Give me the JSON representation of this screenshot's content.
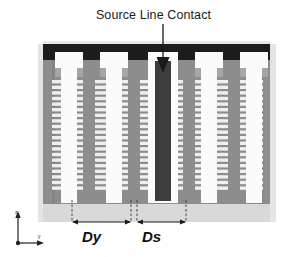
{
  "figure": {
    "type": "cross-section-schematic",
    "annotation": {
      "title": "Source Line Contact",
      "pointer": "downward-arrow"
    },
    "dimensions": [
      {
        "id": "dy",
        "label": "Dy",
        "meaning": "pillar-to-pillar pitch"
      },
      {
        "id": "ds",
        "label": "Ds",
        "meaning": "pillar to source line contact spacing"
      }
    ],
    "axes": {
      "vertical_label": "z",
      "horizontal_label": "y"
    },
    "colors": {
      "top_metal": "#1c1c1c",
      "body_gray": "#8d8d8d",
      "body_gray_dark": "#7a7a7a",
      "wordline_light": "#f2f2f2",
      "pillar_white": "#fbfbfb",
      "substrate": "#d9d9d9",
      "contact_dark": "#3a3a3a",
      "outline": "#555555",
      "text": "#1a1a1a"
    },
    "structure": {
      "pillar_count": 5,
      "wordline_rows": 22,
      "source_line_contact_count": 1
    }
  }
}
